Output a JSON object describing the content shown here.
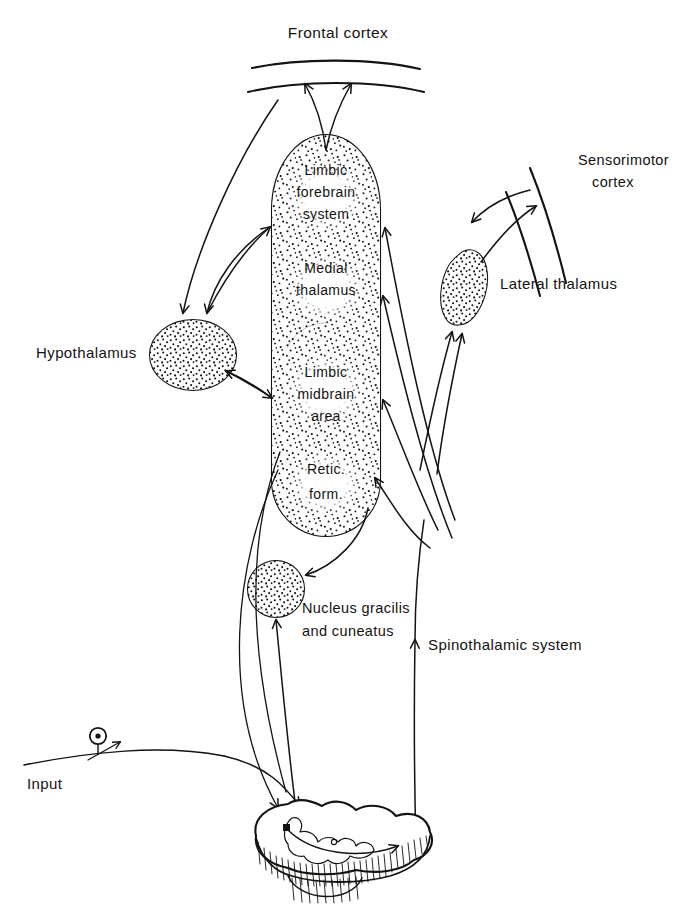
{
  "figure": {
    "type": "neuroanatomical-diagram",
    "ink_color": "#15120f",
    "background_color": "#ffffff"
  },
  "labels": {
    "frontal_cortex": "Frontal cortex",
    "sensorimotor_cortex_line1": "Sensorimotor",
    "sensorimotor_cortex_line2": "cortex",
    "limbic_forebrain_1": "Limbic",
    "limbic_forebrain_2": "forebrain",
    "limbic_forebrain_3": "system",
    "medial_thalamus_1": "Medial",
    "medial_thalamus_2": "thalamus",
    "limbic_midbrain_1": "Limbic",
    "limbic_midbrain_2": "midbrain",
    "limbic_midbrain_3": "area",
    "retic_form_1": "Retic.",
    "retic_form_2": "form.",
    "hypothalamus": "Hypothalamus",
    "lateral_thalamus": "Lateral thalamus",
    "nucleus_gracilis_1": "Nucleus gracilis",
    "nucleus_gracilis_2": "and cuneatus",
    "spinothalamic": "Spinothalamic system",
    "input": "Input"
  },
  "structures": [
    {
      "name": "frontal-cortex",
      "kind": "cortical-band",
      "shading": "none"
    },
    {
      "name": "sensorimotor-cortex",
      "kind": "cortical-band",
      "shading": "none"
    },
    {
      "name": "central-core-column",
      "kind": "stippled-column",
      "shading": "stipple",
      "contains": [
        "limbic forebrain system",
        "medial thalamus",
        "limbic midbrain area",
        "reticular formation"
      ]
    },
    {
      "name": "hypothalamus",
      "kind": "stippled-ellipse",
      "shading": "stipple"
    },
    {
      "name": "lateral-thalamus",
      "kind": "stippled-blob",
      "shading": "stipple"
    },
    {
      "name": "nucleus-gracilis-and-cuneatus",
      "kind": "stippled-circle",
      "shading": "stipple"
    },
    {
      "name": "spinal-cord-section",
      "kind": "cross-section",
      "shading": "hatched-edge"
    },
    {
      "name": "input-neuron",
      "kind": "cell-body-on-fiber",
      "shading": "none"
    }
  ],
  "connections": [
    {
      "from": "limbic forebrain system",
      "to": "frontal cortex",
      "arrow": "double-headed-fan"
    },
    {
      "from": "frontal cortex",
      "to": "hypothalamus",
      "arrow": "single"
    },
    {
      "from": "hypothalamus",
      "to": "limbic forebrain system",
      "arrow": "double"
    },
    {
      "from": "limbic midbrain area",
      "to": "hypothalamus",
      "arrow": "double"
    },
    {
      "from": "lateral thalamus",
      "to": "sensorimotor cortex",
      "arrow": "double"
    },
    {
      "from": "spinothalamic system",
      "to": "lateral thalamus",
      "arrow": "single"
    },
    {
      "from": "nucleus gracilis and cuneatus",
      "to": "lateral thalamus",
      "arrow": "single"
    },
    {
      "from": "spinothalamic system",
      "to": "medial thalamus",
      "arrow": "single"
    },
    {
      "from": "spinothalamic system",
      "to": "limbic forebrain system",
      "arrow": "single"
    },
    {
      "from": "spinothalamic system",
      "to": "limbic midbrain area",
      "arrow": "single"
    },
    {
      "from": "spinothalamic system",
      "to": "reticular formation",
      "arrow": "single"
    },
    {
      "from": "reticular formation",
      "to": "nucleus gracilis and cuneatus",
      "arrow": "single"
    },
    {
      "from": "spinal cord",
      "to": "nucleus gracilis and cuneatus",
      "arrow": "single"
    },
    {
      "from": "reticular formation",
      "to": "spinal cord",
      "arrow": "single"
    },
    {
      "from": "input",
      "to": "spinal cord",
      "arrow": "single"
    },
    {
      "from": "spinal cord",
      "to": "spinothalamic system",
      "arrow": "single"
    }
  ]
}
